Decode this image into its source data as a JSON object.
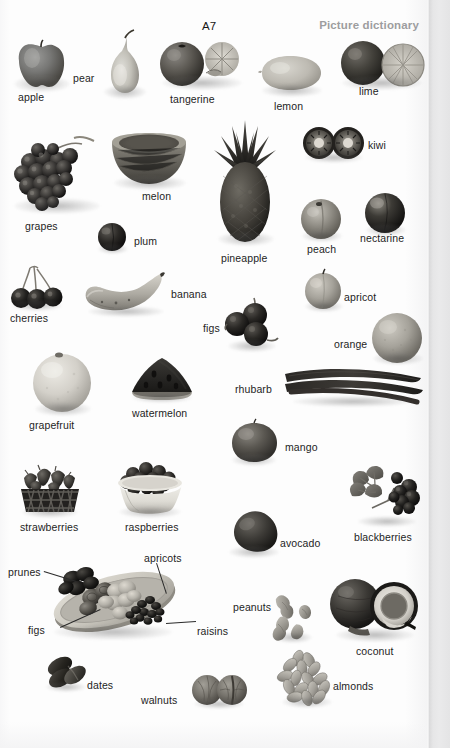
{
  "header": {
    "unit_code": "A7",
    "section_title": "Picture dictionary"
  },
  "entries": [
    {
      "label": "apple",
      "lx": 18,
      "ly": 91
    },
    {
      "label": "pear",
      "lx": 73,
      "ly": 72
    },
    {
      "label": "tangerine",
      "lx": 170,
      "ly": 93
    },
    {
      "label": "lemon",
      "lx": 274,
      "ly": 100
    },
    {
      "label": "lime",
      "lx": 359,
      "ly": 85
    },
    {
      "label": "grapes",
      "lx": 25,
      "ly": 220
    },
    {
      "label": "melon",
      "lx": 142,
      "ly": 190
    },
    {
      "label": "plum",
      "lx": 134,
      "ly": 235
    },
    {
      "label": "pineapple",
      "lx": 221,
      "ly": 252
    },
    {
      "label": "kiwi",
      "lx": 368,
      "ly": 139
    },
    {
      "label": "peach",
      "lx": 307,
      "ly": 243
    },
    {
      "label": "nectarine",
      "lx": 360,
      "ly": 232
    },
    {
      "label": "cherries",
      "lx": 10,
      "ly": 312
    },
    {
      "label": "banana",
      "lx": 171,
      "ly": 288
    },
    {
      "label": "figs",
      "lx": 203,
      "ly": 322
    },
    {
      "label": "apricot",
      "lx": 344,
      "ly": 291
    },
    {
      "label": "orange",
      "lx": 334,
      "ly": 338
    },
    {
      "label": "grapefruit",
      "lx": 29,
      "ly": 419
    },
    {
      "label": "watermelon",
      "lx": 132,
      "ly": 407
    },
    {
      "label": "rhubarb",
      "lx": 235,
      "ly": 383
    },
    {
      "label": "mango",
      "lx": 285,
      "ly": 441
    },
    {
      "label": "strawberries",
      "lx": 20,
      "ly": 521
    },
    {
      "label": "raspberries",
      "lx": 125,
      "ly": 521
    },
    {
      "label": "avocado",
      "lx": 280,
      "ly": 537
    },
    {
      "label": "blackberries",
      "lx": 354,
      "ly": 531
    },
    {
      "label": "peanuts",
      "lx": 233,
      "ly": 601
    },
    {
      "label": "coconut",
      "lx": 356,
      "ly": 645
    },
    {
      "label": "dates",
      "lx": 87,
      "ly": 679
    },
    {
      "label": "walnuts",
      "lx": 141,
      "ly": 694
    },
    {
      "label": "almonds",
      "lx": 333,
      "ly": 680
    },
    {
      "label": "prunes",
      "lx": 8,
      "ly": 566
    },
    {
      "label": "apricots",
      "lx": 144,
      "ly": 552
    },
    {
      "label": "figs2",
      "lx": 28,
      "ly": 624
    },
    {
      "label": "raisins",
      "lx": 197,
      "ly": 625
    }
  ],
  "platter_labels": {
    "prunes": "prunes",
    "apricots": "apricots",
    "figs": "figs",
    "raisins": "raisins"
  },
  "colors": {
    "text": "#1d1d1d",
    "section_title": "#9d9d9f",
    "paper": "#fdfdfd",
    "gutter": "#e6e6e7"
  }
}
